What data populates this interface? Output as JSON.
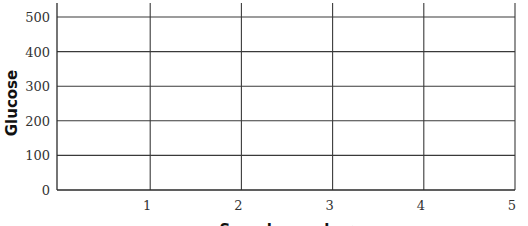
{
  "chart_data": {
    "type": "line",
    "title": "",
    "xlabel": "Sample number",
    "ylabel": "Glucose",
    "x_ticks": [
      1,
      2,
      3,
      4,
      5
    ],
    "y_ticks": [
      0,
      100,
      200,
      300,
      400,
      500
    ],
    "xlim": [
      0,
      5
    ],
    "ylim": [
      0,
      500
    ],
    "grid": true,
    "series": [],
    "note": "Empty grid with no plotted data"
  },
  "colors": {
    "grid": "#3a3a3a",
    "text": "#333333",
    "background": "#ffffff"
  }
}
